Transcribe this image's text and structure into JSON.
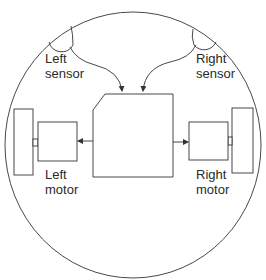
{
  "diagram": {
    "colors": {
      "line": "#333333",
      "background": "#ffffff"
    },
    "labels": {
      "left_sensor": [
        "Left",
        "sensor"
      ],
      "right_sensor": [
        "Right",
        "sensor"
      ],
      "left_motor": [
        "Left",
        "motor"
      ],
      "right_motor": [
        "Right",
        "motor"
      ]
    },
    "nodes": [
      {
        "id": "body",
        "shape": "circle"
      },
      {
        "id": "left-sensor",
        "shape": "semicircle"
      },
      {
        "id": "right-sensor",
        "shape": "semicircle"
      },
      {
        "id": "controller",
        "shape": "chamfered-rectangle"
      },
      {
        "id": "left-motor",
        "shape": "rectangle"
      },
      {
        "id": "right-motor",
        "shape": "rectangle"
      },
      {
        "id": "left-wheel",
        "shape": "rectangle"
      },
      {
        "id": "right-wheel",
        "shape": "rectangle"
      }
    ],
    "edges": [
      {
        "from": "left-sensor",
        "to": "controller",
        "style": "curved-arrow"
      },
      {
        "from": "right-sensor",
        "to": "controller",
        "style": "curved-arrow"
      },
      {
        "from": "controller",
        "to": "left-motor",
        "style": "arrow"
      },
      {
        "from": "controller",
        "to": "right-motor",
        "style": "arrow"
      },
      {
        "from": "left-motor",
        "to": "left-wheel",
        "style": "shaft"
      },
      {
        "from": "right-motor",
        "to": "right-wheel",
        "style": "shaft"
      }
    ]
  }
}
